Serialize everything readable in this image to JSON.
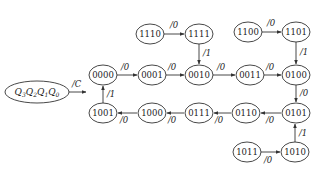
{
  "diagram": {
    "type": "state-transition",
    "legend": {
      "label_parts": [
        {
          "var": "Q",
          "sub": "3"
        },
        {
          "var": "Q",
          "sub": "2"
        },
        {
          "var": "Q",
          "sub": "1"
        },
        {
          "var": "Q",
          "sub": "0"
        }
      ],
      "output_label": "/C"
    },
    "states": [
      {
        "id": "s0000",
        "label": "0000"
      },
      {
        "id": "s0001",
        "label": "0001"
      },
      {
        "id": "s0010",
        "label": "0010"
      },
      {
        "id": "s0011",
        "label": "0011"
      },
      {
        "id": "s0100",
        "label": "0100"
      },
      {
        "id": "s0101",
        "label": "0101"
      },
      {
        "id": "s0110",
        "label": "0110"
      },
      {
        "id": "s0111",
        "label": "0111"
      },
      {
        "id": "s1000",
        "label": "1000"
      },
      {
        "id": "s1001",
        "label": "1001"
      },
      {
        "id": "s1010",
        "label": "1010"
      },
      {
        "id": "s1011",
        "label": "1011"
      },
      {
        "id": "s1100",
        "label": "1100"
      },
      {
        "id": "s1101",
        "label": "1101"
      },
      {
        "id": "s1110",
        "label": "1110"
      },
      {
        "id": "s1111",
        "label": "1111"
      }
    ],
    "transitions": [
      {
        "from": "0000",
        "to": "0001",
        "label": "/0"
      },
      {
        "from": "0001",
        "to": "0010",
        "label": "/0"
      },
      {
        "from": "0010",
        "to": "0011",
        "label": "/0"
      },
      {
        "from": "0011",
        "to": "0100",
        "label": "/0"
      },
      {
        "from": "0100",
        "to": "0101",
        "label": "/0"
      },
      {
        "from": "0101",
        "to": "0110",
        "label": "/0"
      },
      {
        "from": "0110",
        "to": "0111",
        "label": "/0"
      },
      {
        "from": "0111",
        "to": "1000",
        "label": "/0"
      },
      {
        "from": "1000",
        "to": "1001",
        "label": "/0"
      },
      {
        "from": "1001",
        "to": "0000",
        "label": "/1"
      },
      {
        "from": "1110",
        "to": "1111",
        "label": "/0"
      },
      {
        "from": "1111",
        "to": "0010",
        "label": "/1"
      },
      {
        "from": "1100",
        "to": "1101",
        "label": "/0"
      },
      {
        "from": "1101",
        "to": "0100",
        "label": "/1"
      },
      {
        "from": "1011",
        "to": "1010",
        "label": "/0"
      },
      {
        "from": "1010",
        "to": "0101",
        "label": "/1"
      }
    ]
  }
}
